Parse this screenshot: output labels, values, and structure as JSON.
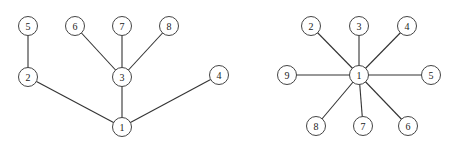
{
  "diagrams": [
    {
      "name": "tree-left",
      "nodes": [
        {
          "id": "1",
          "label": "1",
          "x": 122,
          "y": 127
        },
        {
          "id": "2",
          "label": "2",
          "x": 28,
          "y": 77
        },
        {
          "id": "3",
          "label": "3",
          "x": 122,
          "y": 77
        },
        {
          "id": "4",
          "label": "4",
          "x": 219,
          "y": 75
        },
        {
          "id": "5",
          "label": "5",
          "x": 28,
          "y": 26
        },
        {
          "id": "6",
          "label": "6",
          "x": 75,
          "y": 26
        },
        {
          "id": "7",
          "label": "7",
          "x": 122,
          "y": 26
        },
        {
          "id": "8",
          "label": "8",
          "x": 169,
          "y": 26
        }
      ],
      "edges": [
        [
          "1",
          "2"
        ],
        [
          "1",
          "3"
        ],
        [
          "1",
          "4"
        ],
        [
          "2",
          "5"
        ],
        [
          "3",
          "6"
        ],
        [
          "3",
          "7"
        ],
        [
          "3",
          "8"
        ]
      ]
    },
    {
      "name": "star-right",
      "nodes": [
        {
          "id": "1",
          "label": "1",
          "x": 359,
          "y": 75
        },
        {
          "id": "2",
          "label": "2",
          "x": 311,
          "y": 26
        },
        {
          "id": "3",
          "label": "3",
          "x": 359,
          "y": 26
        },
        {
          "id": "4",
          "label": "4",
          "x": 407,
          "y": 26
        },
        {
          "id": "5",
          "label": "5",
          "x": 431,
          "y": 75
        },
        {
          "id": "6",
          "label": "6",
          "x": 408,
          "y": 126
        },
        {
          "id": "7",
          "label": "7",
          "x": 363,
          "y": 126
        },
        {
          "id": "8",
          "label": "8",
          "x": 316,
          "y": 126
        },
        {
          "id": "9",
          "label": "9",
          "x": 287,
          "y": 75
        }
      ],
      "edges": [
        [
          "1",
          "2"
        ],
        [
          "1",
          "3"
        ],
        [
          "1",
          "4"
        ],
        [
          "1",
          "5"
        ],
        [
          "1",
          "6"
        ],
        [
          "1",
          "7"
        ],
        [
          "1",
          "8"
        ],
        [
          "1",
          "9"
        ]
      ]
    }
  ],
  "style": {
    "node_radius": 9.5,
    "stroke": "#444444",
    "edge": "#333333",
    "background": "#ffffff"
  }
}
